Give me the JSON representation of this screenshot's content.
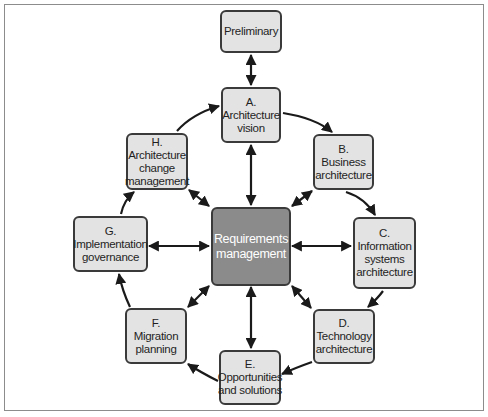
{
  "diagram": {
    "type": "cycle-diagram",
    "colors": {
      "node_fill": "#e3e3e3",
      "node_border": "#3a3a3a",
      "center_fill": "#8b8b8b",
      "center_text": "#ffffff",
      "arrow": "#1a1a1a",
      "frame": "#8c8c8c"
    },
    "nodes": {
      "preliminary": {
        "lines": [
          "Preliminary"
        ]
      },
      "a": {
        "lines": [
          "A.",
          "Architecture",
          "vision"
        ]
      },
      "b": {
        "lines": [
          "B.",
          "Business",
          "architecture"
        ]
      },
      "c": {
        "lines": [
          "C.",
          "Information",
          "systems",
          "architecture"
        ]
      },
      "d": {
        "lines": [
          "D.",
          "Technology",
          "architecture"
        ]
      },
      "e": {
        "lines": [
          "E.",
          "Opportunities",
          "and solutions"
        ]
      },
      "f": {
        "lines": [
          "F.",
          "Migration",
          "planning"
        ]
      },
      "g": {
        "lines": [
          "G.",
          "Implementation",
          "governance"
        ]
      },
      "h": {
        "lines": [
          "H.",
          "Architecture",
          "change",
          "management"
        ]
      },
      "center": {
        "lines": [
          "Requirements",
          "management"
        ]
      }
    },
    "edges": [
      {
        "from": "preliminary",
        "to": "a",
        "style": "double-arrow"
      },
      {
        "from": "a",
        "to": "b",
        "style": "curved-arrow"
      },
      {
        "from": "b",
        "to": "c",
        "style": "arrow"
      },
      {
        "from": "c",
        "to": "d",
        "style": "curved-arrow"
      },
      {
        "from": "d",
        "to": "e",
        "style": "arrow"
      },
      {
        "from": "e",
        "to": "f",
        "style": "arrow"
      },
      {
        "from": "f",
        "to": "g",
        "style": "curved-arrow"
      },
      {
        "from": "g",
        "to": "h",
        "style": "curved-arrow"
      },
      {
        "from": "h",
        "to": "a",
        "style": "curved-arrow"
      },
      {
        "from": "center",
        "to": "a",
        "style": "double-arrow"
      },
      {
        "from": "center",
        "to": "b",
        "style": "double-arrow"
      },
      {
        "from": "center",
        "to": "c",
        "style": "double-arrow"
      },
      {
        "from": "center",
        "to": "d",
        "style": "double-arrow"
      },
      {
        "from": "center",
        "to": "e",
        "style": "double-arrow"
      },
      {
        "from": "center",
        "to": "f",
        "style": "double-arrow"
      },
      {
        "from": "center",
        "to": "g",
        "style": "double-arrow"
      },
      {
        "from": "center",
        "to": "h",
        "style": "double-arrow"
      }
    ]
  }
}
